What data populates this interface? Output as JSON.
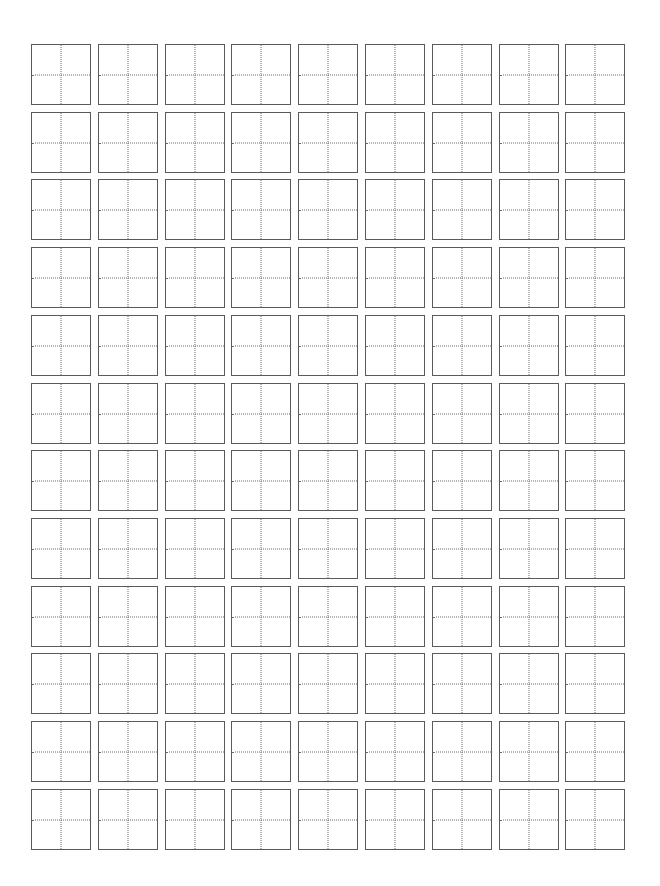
{
  "page": {
    "type": "tianzige-practice-grid",
    "background_color": "#ffffff"
  },
  "grid": {
    "columns": 9,
    "rows": 12,
    "origin_x": 31,
    "origin_y": 44,
    "pitch_x": 66.8,
    "pitch_y": 67.7,
    "cell_width": 60,
    "cell_height": 61,
    "border_color": "#5a5a5a",
    "guide_color": "#6a6a6a",
    "guide_style": "dotted",
    "guides": [
      "vertical-center",
      "horizontal-center"
    ],
    "cell_content": ""
  }
}
